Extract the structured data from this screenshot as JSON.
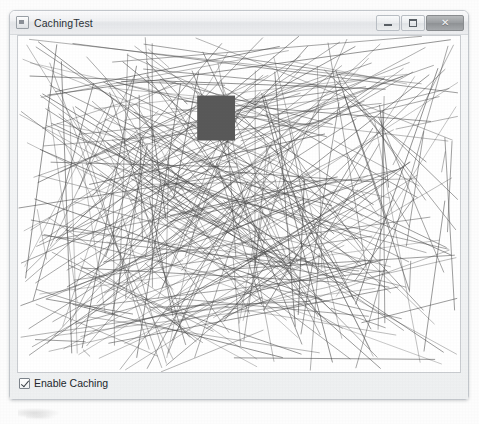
{
  "window": {
    "title": "CachingTest",
    "sysmenu_icon": "system-menu-icon",
    "controls": {
      "minimize": {
        "icon": "minimize-icon",
        "glyph": ""
      },
      "maximize": {
        "icon": "maximize-icon",
        "glyph": ""
      },
      "close": {
        "icon": "close-icon",
        "glyph": "✕"
      }
    }
  },
  "canvas": {
    "name": "drawing-canvas",
    "background_color": "#ffffff",
    "line_color": "#4a4a4a",
    "line_count": 320,
    "line_width": 0.7,
    "square": {
      "name": "cached-square",
      "x": 180,
      "y": 61,
      "width": 38,
      "height": 46,
      "fill": "#595959"
    }
  },
  "options": {
    "enable_caching": {
      "label": "Enable Caching",
      "checked": true
    }
  },
  "colors": {
    "window_frame": "#c3c7cc",
    "titlebar_top": "#fbfbfc",
    "titlebar_bottom": "#edeef0",
    "client_background": "#f2f3f4",
    "close_button": "#9b9ea1",
    "text": "#23282d"
  }
}
